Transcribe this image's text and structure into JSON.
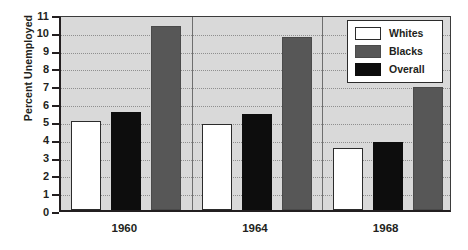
{
  "chart_data": {
    "type": "bar",
    "title": "",
    "xlabel": "",
    "ylabel": "Percent Unemployed",
    "ylim": [
      0,
      11
    ],
    "ytick_labels": [
      "0",
      "1",
      "2",
      "3",
      "4",
      "5",
      "6",
      "7",
      "8",
      "9",
      "10",
      "11"
    ],
    "grid": true,
    "legend_position": "top-right",
    "categories": [
      "1960",
      "1964",
      "1968"
    ],
    "series": [
      {
        "name": "Whites",
        "color": "#ffffff",
        "values": [
          5.0,
          4.8,
          3.5
        ]
      },
      {
        "name": "Overall",
        "color": "#0d0d0d",
        "values": [
          5.5,
          5.4,
          3.8
        ]
      },
      {
        "name": "Blacks",
        "color": "#575757",
        "values": [
          10.3,
          9.7,
          6.9
        ]
      }
    ],
    "bar_draw_order": [
      "Whites",
      "Overall",
      "Blacks"
    ],
    "legend_order": [
      "Whites",
      "Blacks",
      "Overall"
    ],
    "plot_background": "#d9d9d9",
    "axis_color": "#231f20"
  }
}
